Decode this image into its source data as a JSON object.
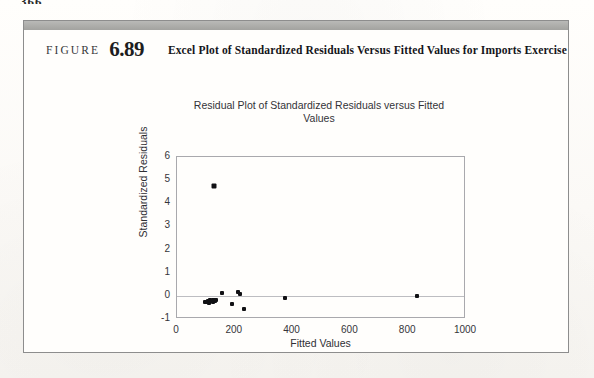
{
  "page": {
    "folio": "366"
  },
  "figure": {
    "label_word": "FIGURE",
    "number": "6.89",
    "title": "Excel Plot of Standardized Residuals Versus Fitted Values for Imports Exercise"
  },
  "chart_data": {
    "type": "scatter",
    "title": "Residual Plot of Standardized Residuals versus Fitted Values",
    "title_line1": "Residual Plot of Standardized Residuals versus Fitted",
    "title_line2": "Values",
    "xlabel": "Fitted Values",
    "ylabel": "Standardized Residuals",
    "xlim": [
      0,
      1000
    ],
    "ylim": [
      -1,
      6
    ],
    "xticks": [
      0,
      200,
      400,
      600,
      800,
      1000
    ],
    "yticks": [
      -1,
      0,
      1,
      2,
      3,
      4,
      5,
      6
    ],
    "grid": false,
    "zero_line": true,
    "legend": "none",
    "marker_color": "#111114",
    "series": [
      {
        "name": "Standardized Residuals",
        "points": [
          [
            98,
            -0.25
          ],
          [
            103,
            -0.28
          ],
          [
            106,
            -0.22
          ],
          [
            109,
            -0.3
          ],
          [
            112,
            -0.26
          ],
          [
            114,
            -0.19
          ],
          [
            117,
            -0.24
          ],
          [
            120,
            -0.21
          ],
          [
            123,
            -0.27
          ],
          [
            126,
            -0.18
          ],
          [
            128,
            4.73
          ],
          [
            130,
            -0.23
          ],
          [
            133,
            -0.2
          ],
          [
            136,
            -0.17
          ],
          [
            155,
            0.12
          ],
          [
            190,
            -0.35
          ],
          [
            212,
            0.18
          ],
          [
            219,
            0.1
          ],
          [
            232,
            -0.55
          ],
          [
            375,
            -0.1
          ],
          [
            830,
            0.0
          ]
        ]
      }
    ]
  }
}
